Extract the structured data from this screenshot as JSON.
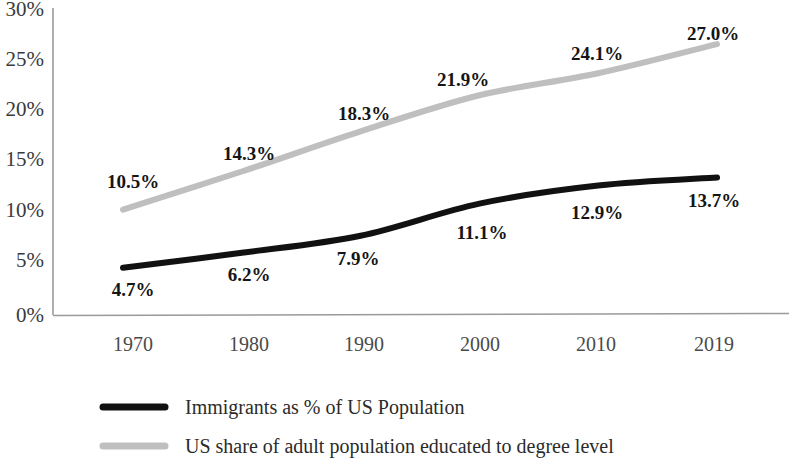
{
  "chart_data": {
    "type": "line",
    "title": "",
    "subtitle": "",
    "xlabel": "",
    "ylabel": "",
    "grid": false,
    "legend_position": "bottom-left",
    "categories": [
      "1970",
      "1980",
      "1990",
      "2000",
      "2010",
      "2019"
    ],
    "x": [
      1970,
      1980,
      1990,
      2000,
      2010,
      2019
    ],
    "ylim": [
      0,
      30
    ],
    "ytick_labels": [
      "0%",
      "5%",
      "10%",
      "15%",
      "20%",
      "25%",
      "30%"
    ],
    "ytick_values": [
      0,
      5,
      10,
      15,
      20,
      25,
      30
    ],
    "xtick_labels": [
      "1970",
      "1980",
      "1990",
      "2000",
      "2010",
      "2019"
    ],
    "series": [
      {
        "name": "Immigrants as % of US Population",
        "color": "#111111",
        "values": [
          4.7,
          6.2,
          7.9,
          11.1,
          12.9,
          13.7
        ],
        "data_labels": [
          "4.7%",
          "6.2%",
          "7.9%",
          "11.1%",
          "12.9%",
          "13.7%"
        ],
        "label_position": "below"
      },
      {
        "name": "US share of adult population educated to degree level",
        "color": "#bfbfbf",
        "values": [
          10.5,
          14.3,
          18.3,
          21.9,
          24.1,
          27.0
        ],
        "data_labels": [
          "10.5%",
          "14.3%",
          "18.3%",
          "21.9%",
          "24.1%",
          "27.0%"
        ],
        "label_position": "above"
      }
    ]
  },
  "axis": {
    "y_ticks": [
      {
        "label": "30%"
      },
      {
        "label": "25%"
      },
      {
        "label": "20%"
      },
      {
        "label": "15%"
      },
      {
        "label": "10%"
      },
      {
        "label": "5%"
      },
      {
        "label": "0%"
      }
    ],
    "x_ticks": [
      {
        "label": "1970"
      },
      {
        "label": "1980"
      },
      {
        "label": "1990"
      },
      {
        "label": "2000"
      },
      {
        "label": "2010"
      },
      {
        "label": "2019"
      }
    ]
  },
  "labels": {
    "immigrants": {
      "p1970": "4.7%",
      "p1980": "6.2%",
      "p1990": "7.9%",
      "p2000": "11.1%",
      "p2010": "12.9%",
      "p2019": "13.7%"
    },
    "degree": {
      "p1970": "10.5%",
      "p1980": "14.3%",
      "p1990": "18.3%",
      "p2000": "21.9%",
      "p2010": "24.1%",
      "p2019": "27.0%"
    }
  },
  "legend": {
    "items": [
      {
        "label": "Immigrants as % of US Population",
        "color": "#111111"
      },
      {
        "label": "US share of adult population educated to degree level",
        "color": "#bfbfbf"
      }
    ]
  },
  "colors": {
    "immigrants_line": "#111111",
    "degree_line": "#bfbfbf",
    "axis": "#9a9a9a",
    "tick_text": "#3a3a3a",
    "background": "#ffffff"
  }
}
